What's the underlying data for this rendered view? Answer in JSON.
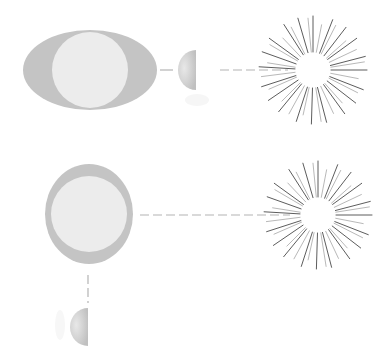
{
  "diagram": {
    "colors": {
      "background": "#ffffff",
      "tidal_bulge": "#c4c4c4",
      "earth": "#ececec",
      "moon_light": "#d6d6d6",
      "connector": "#b4b4b4",
      "sun_ray": "#555555"
    },
    "panels": [
      {
        "name": "aligned",
        "earth": {
          "cx": 90,
          "cy": 70,
          "bulge_rx": 67,
          "bulge_ry": 40,
          "radius": 38
        },
        "moon": {
          "cx": 200,
          "cy": 70,
          "r": 17
        },
        "sun": {
          "cx": 313,
          "cy": 70,
          "r": 17
        }
      },
      {
        "name": "perpendicular",
        "earth": {
          "cx": 89,
          "cy": 214,
          "bulge_rx": 44,
          "bulge_ry": 50,
          "radius": 38
        },
        "moon": {
          "cx": 88,
          "cy": 327,
          "r": 17
        },
        "sun": {
          "cx": 318,
          "cy": 215,
          "r": 17
        }
      }
    ]
  }
}
